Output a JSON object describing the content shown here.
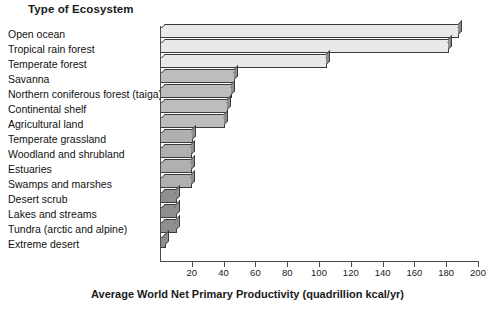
{
  "chart_data": {
    "type": "bar",
    "orientation": "horizontal",
    "title": "Type of Ecosystem",
    "xlabel": "Average World Net Primary Productivity (quadrillion kcal/yr)",
    "ylabel": "Type of Ecosystem",
    "xlim": [
      0,
      200
    ],
    "xticks": [
      20,
      40,
      60,
      80,
      100,
      120,
      140,
      160,
      180,
      200
    ],
    "grid": false,
    "legend": null,
    "categories": [
      "Open ocean",
      "Tropical rain forest",
      "Temperate forest",
      "Savanna",
      "Northern coniferous forest (taiga)",
      "Continental shelf",
      "Agricultural land",
      "Temperate grassland",
      "Woodland and shrubland",
      "Estuaries",
      "Swamps and marshes",
      "Desert scrub",
      "Lakes and streams",
      "Tundra (arctic and alpine)",
      "Extreme desert"
    ],
    "values": [
      188,
      182,
      105,
      47,
      45,
      43,
      41,
      21,
      20,
      20,
      20,
      11,
      11,
      11,
      4
    ],
    "bar_colors": [
      "#e9e9e9",
      "#e9e9e9",
      "#e9e9e9",
      "#bdbdbd",
      "#bdbdbd",
      "#bdbdbd",
      "#bdbdbd",
      "#b0b0b0",
      "#b0b0b0",
      "#b0b0b0",
      "#b0b0b0",
      "#8f8f8f",
      "#8f8f8f",
      "#8f8f8f",
      "#8f8f8f"
    ]
  },
  "style": {
    "background": "#ffffff",
    "axis_color": "#4a4a4a",
    "text_color": "#1a1a1a",
    "bar_outline": "#3a3a3a"
  }
}
